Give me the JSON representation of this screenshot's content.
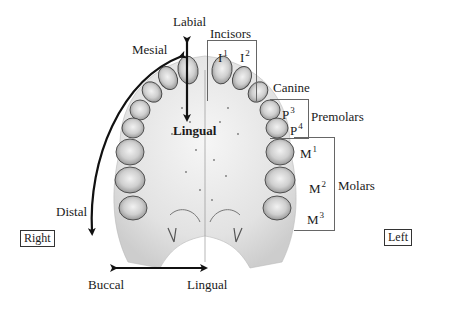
{
  "diagram": {
    "orientation": {
      "labial": "Labial",
      "lingual_center": "Lingual",
      "mesial": "Mesial",
      "distal": "Distal",
      "buccal": "Buccal",
      "lingual_bottom": "Lingual",
      "right": "Right",
      "left": "Left"
    },
    "groups": {
      "incisors": "Incisors",
      "canine": "Canine",
      "premolars": "Premolars",
      "molars": "Molars"
    },
    "teeth": {
      "i1": {
        "base": "I",
        "sup": "1"
      },
      "i2": {
        "base": "I",
        "sup": "2"
      },
      "p3": {
        "base": "P",
        "sup": "3"
      },
      "p4": {
        "base": "P",
        "sup": "4"
      },
      "m1": {
        "base": "M",
        "sup": "1"
      },
      "m2": {
        "base": "M",
        "sup": "2"
      },
      "m3": {
        "base": "M",
        "sup": "3"
      }
    },
    "colors": {
      "ink": "#1a1a1a",
      "tooth_fill": "#e4e4e4",
      "tooth_shade": "#9a9a9a",
      "palate": "#eeeeee",
      "bracket": "#666666"
    }
  }
}
